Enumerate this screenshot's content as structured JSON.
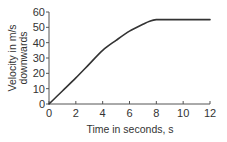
{
  "chart_data": {
    "type": "line",
    "title": "",
    "xlabel": "Time in seconds, s",
    "ylabel_lines": [
      "Velocity in m/s",
      "downwards"
    ],
    "xlim": [
      0,
      12
    ],
    "ylim": [
      0,
      60
    ],
    "x_ticks": [
      0,
      2,
      4,
      6,
      8,
      10,
      12
    ],
    "y_ticks": [
      0,
      10,
      20,
      30,
      40,
      50,
      60
    ],
    "grid": false,
    "legend": "none",
    "series": [
      {
        "name": "Velocity",
        "color": "#333333",
        "x": [
          0,
          1,
          2,
          3,
          4,
          5,
          6,
          7,
          7.5,
          8,
          9,
          10,
          11,
          12
        ],
        "y": [
          0,
          8.5,
          17,
          26,
          35,
          41.5,
          47.5,
          52,
          54,
          55,
          55,
          55,
          55,
          55
        ]
      }
    ]
  }
}
